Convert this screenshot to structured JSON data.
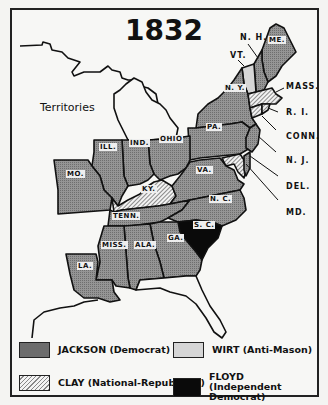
{
  "map": {
    "title": "1832",
    "territories_label": "Territories",
    "colors": {
      "jackson": "#8f8f8f",
      "clay_hatch": "#888888",
      "wirt": "#d6d6d6",
      "floyd": "#0a0a0a",
      "background": "#f7f7f5",
      "border": "#222222"
    },
    "states": {
      "me": "ME.",
      "nh": "N. H.",
      "vt": "VT.",
      "ny": "N. Y.",
      "mass": "MASS.",
      "ri": "R. I.",
      "conn": "CONN.",
      "nj": "N. J.",
      "del": "DEL.",
      "md": "MD.",
      "pa": "PA.",
      "ohio": "OHIO",
      "ind": "IND.",
      "ill": "ILL.",
      "mo": "MO.",
      "ky": "KY.",
      "va": "VA.",
      "nc": "N. C.",
      "sc": "S. C.",
      "tenn": "TENN.",
      "miss": "MISS.",
      "ala": "ALA.",
      "ga": "GA.",
      "la": "LA."
    },
    "results": {
      "jackson": [
        "ME.",
        "N. H.",
        "N. Y.",
        "N. J.",
        "PA.",
        "OHIO",
        "IND.",
        "ILL.",
        "MO.",
        "VA.",
        "N. C.",
        "TENN.",
        "MISS.",
        "ALA.",
        "GA.",
        "LA.",
        "MD. (part)"
      ],
      "clay": [
        "MASS.",
        "R. I.",
        "CONN.",
        "DEL.",
        "KY.",
        "MD. (part)"
      ],
      "wirt": [
        "VT."
      ],
      "floyd": [
        "S. C."
      ]
    }
  },
  "legend": {
    "items": [
      {
        "key": "jackson",
        "label": "JACKSON (Democrat)"
      },
      {
        "key": "wirt",
        "label": "WIRT (Anti-Mason)"
      },
      {
        "key": "clay",
        "label": "CLAY (National-Republican)"
      },
      {
        "key": "floyd",
        "label_line1": "FLOYD",
        "label_line2": "(Independent Democrat)"
      }
    ]
  }
}
